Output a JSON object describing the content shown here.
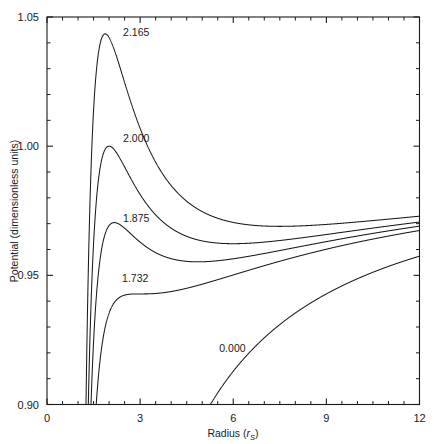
{
  "chart_data": {
    "type": "line",
    "title": "",
    "xlabel": "Radius (r_S)",
    "xlabel_main": "Radius (r",
    "xlabel_sub": "S",
    "xlabel_tail": ")",
    "ylabel": "Potential (dimensionless units)",
    "xlim": [
      0,
      12
    ],
    "ylim": [
      0.9,
      1.05
    ],
    "xticks": [
      0,
      3,
      6,
      9,
      12
    ],
    "xtick_labels": [
      "0",
      "3",
      "6",
      "9",
      "12"
    ],
    "x_minor_step": 0.5,
    "yticks": [
      0.9,
      0.95,
      1.0,
      1.05
    ],
    "ytick_labels": [
      "0.90",
      "0.95",
      "1.00",
      "1.05"
    ],
    "y_minor_step": 0.01,
    "grid": false,
    "legend_position": "inline-curve-labels",
    "line_color": "#1a1a1a",
    "background": "#ffffff",
    "formula": "V(r) = sqrt((1 - 1/r) * (1 + L^2/r^2))",
    "series": [
      {
        "name": "2.165",
        "label": "2.165",
        "angular_momentum": 2.165,
        "label_x": 2.45,
        "label_y": 1.0425,
        "peak": {
          "r": 1.9,
          "V": 1.0435
        },
        "minimum": {
          "r": 6.6,
          "V": 0.9683
        },
        "value_at_12": 0.9705
      },
      {
        "name": "2.000",
        "label": "2.000",
        "angular_momentum": 2.0,
        "label_x": 2.45,
        "label_y": 1.0015,
        "peak": {
          "r": 2.1,
          "V": 1.0
        },
        "minimum": {
          "r": 5.0,
          "V": 0.9614
        },
        "value_at_12": 0.9695
      },
      {
        "name": "1.875",
        "label": "1.875",
        "angular_momentum": 1.875,
        "label_x": 2.45,
        "label_y": 0.9705,
        "peak": {
          "r": 2.28,
          "V": 0.9686
        },
        "minimum": {
          "r": 4.22,
          "V": 0.9542
        },
        "value_at_12": 0.9687
      },
      {
        "name": "1.732",
        "label": "1.732",
        "angular_momentum": 1.7320508,
        "label_x": 2.42,
        "label_y": 0.9473,
        "peak": {
          "r": 3.0,
          "V": 0.9428
        },
        "minimum": {
          "r": 3.0,
          "V": 0.9428
        },
        "value_at_12": 0.9672
      },
      {
        "name": "0.000",
        "label": "0.000",
        "angular_momentum": 0.0,
        "label_x": 5.55,
        "label_y": 0.9205,
        "peak": null,
        "minimum": null,
        "value_at_12": 0.9574,
        "x_intercept_at_ymin": 5.26
      }
    ]
  }
}
